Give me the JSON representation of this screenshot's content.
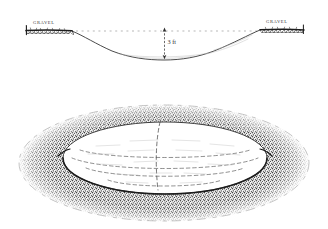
{
  "figure": {
    "medium": "pen-and-ink line drawing",
    "background_color": "#ffffff",
    "ink_color": "#222222"
  },
  "panels": [
    {
      "id": "cross-section",
      "name": "cross-section-panel",
      "description": "Profile view of a shallow dished basin cut into a gravel bed",
      "ground_line_style": "dotted",
      "labels": {
        "left_bank": "GRAVEL",
        "right_bank": "GRAVEL"
      },
      "dimension": {
        "name": "depth-dimension",
        "value": "3",
        "unit": "ft",
        "text": "3 ft",
        "orientation": "vertical",
        "arrow_heads": "both"
      }
    },
    {
      "id": "perspective",
      "name": "perspective-panel",
      "description": "Oblique oval view of the same depression showing stippled gravel rim and dashed interior contours",
      "rim_texture": "stippled gravel with grass tufts",
      "interior_contours": "dashed",
      "contour_count": 4
    }
  ]
}
